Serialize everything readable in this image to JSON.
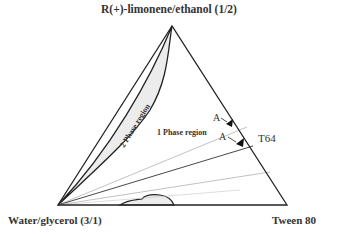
{
  "diagram": {
    "type": "ternary-phase-diagram",
    "vertices": {
      "top": "R(+)-limonene/ethanol (1/2)",
      "bottom_left": "Water/glycerol (3/1)",
      "bottom_right": "Tween 80"
    },
    "regions": {
      "two_phase": "2 Phase region",
      "one_phase": "1 Phase region"
    },
    "points": [
      {
        "label": "A",
        "marker": "triangle"
      },
      {
        "label": "A",
        "marker": "triangle"
      }
    ],
    "annotation": "T64",
    "colors": {
      "line": "#222222",
      "fill_region": "#ececec",
      "dilution_line": "#999999"
    }
  }
}
